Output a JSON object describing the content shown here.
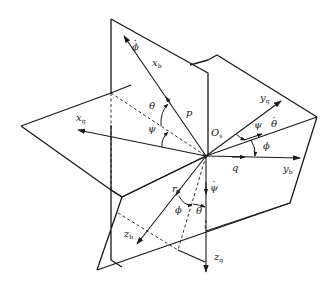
{
  "diagram": {
    "colors": {
      "line": "#1a1a1a",
      "background": "#ffffff"
    },
    "origin": {
      "label": "O",
      "sub": "s",
      "x": 206,
      "y": 156
    },
    "labels": {
      "phi_dot_top": {
        "text": "ϕ",
        "dot": true,
        "x": 132,
        "y": 44
      },
      "x_b": {
        "text": "x",
        "sub": "b",
        "x": 152,
        "y": 60
      },
      "theta_upper": {
        "text": "θ",
        "x": 150,
        "y": 104
      },
      "p": {
        "text": "p",
        "x": 186,
        "y": 110
      },
      "x_g": {
        "text": "x",
        "sub": "g",
        "x": 77,
        "y": 115
      },
      "psi_upper": {
        "text": "ψ",
        "x": 149,
        "y": 126
      },
      "O_s": {
        "text": "O",
        "sub": "s",
        "x": 212,
        "y": 130
      },
      "y_g": {
        "text": "y",
        "sub": "g",
        "x": 260,
        "y": 95
      },
      "psi_right": {
        "text": "ψ",
        "x": 255,
        "y": 122
      },
      "theta_dot": {
        "text": "θ",
        "dot": true,
        "x": 272,
        "y": 121
      },
      "phi_right": {
        "text": "ϕ",
        "x": 263,
        "y": 143
      },
      "q": {
        "text": "q",
        "x": 232,
        "y": 165
      },
      "y_b": {
        "text": "y",
        "sub": "b",
        "x": 283,
        "y": 166
      },
      "psi_dot": {
        "text": "ψ",
        "dot": true,
        "x": 211,
        "y": 185
      },
      "r": {
        "text": "r",
        "x": 172,
        "y": 186
      },
      "phi_lower": {
        "text": "ϕ",
        "x": 176,
        "y": 207
      },
      "theta_lower": {
        "text": "θ",
        "x": 196,
        "y": 208
      },
      "z_b": {
        "text": "z",
        "sub": "b",
        "x": 124,
        "y": 231
      },
      "z_g": {
        "text": "z",
        "sub": "g",
        "x": 214,
        "y": 254
      }
    }
  }
}
